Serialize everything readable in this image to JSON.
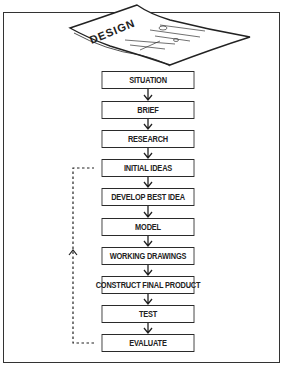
{
  "diagram": {
    "header_graphic": {
      "label": "DESIGN",
      "type": "tilted-paper-sheet"
    },
    "steps": [
      {
        "label": "SITUATION",
        "top": 71
      },
      {
        "label": "BRIEF",
        "top": 101
      },
      {
        "label": "RESEARCH",
        "top": 130
      },
      {
        "label": "INITIAL IDEAS",
        "top": 159
      },
      {
        "label": "DEVELOP BEST IDEA",
        "top": 188
      },
      {
        "label": "MODEL",
        "top": 218
      },
      {
        "label": "WORKING DRAWINGS",
        "top": 247
      },
      {
        "label": "CONSTRUCT FINAL PRODUCT",
        "top": 276
      },
      {
        "label": "TEST",
        "top": 305
      },
      {
        "label": "EVALUATE",
        "top": 334
      }
    ],
    "feedback_loop": {
      "from": "EVALUATE",
      "to": "INITIAL IDEAS",
      "style": "dashed"
    },
    "colors": {
      "stroke": "#2a2a2a",
      "text": "#222222",
      "background": "#ffffff"
    }
  }
}
